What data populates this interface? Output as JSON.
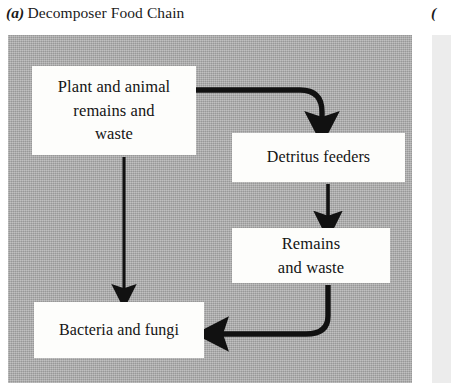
{
  "figure": {
    "panel_a": {
      "letter": "(a)",
      "title": "Decomposer Food Chain"
    },
    "panel_b": {
      "letter": "(",
      "title": ""
    },
    "colors": {
      "plate_gray": "#a9a9a9",
      "box_white": "#fdfdfb",
      "ink_black": "#141414",
      "panel_b_gray": "#ececec"
    },
    "nodes": [
      {
        "id": "plant-animal-remains-waste",
        "lines": [
          "Plant and animal",
          "remains  and",
          "waste"
        ]
      },
      {
        "id": "detritus-feeders",
        "lines": [
          "Detritus feeders"
        ]
      },
      {
        "id": "remains-and-waste",
        "lines": [
          "Remains",
          "and waste"
        ]
      },
      {
        "id": "bacteria-and-fungi",
        "lines": [
          "Bacteria and fungi"
        ]
      }
    ],
    "arrows": [
      {
        "id": "arrow-source-to-detritus",
        "from": "plant-animal-remains-waste",
        "to": "detritus-feeders",
        "style": "curved-thick"
      },
      {
        "id": "arrow-source-to-bacteria",
        "from": "plant-animal-remains-waste",
        "to": "bacteria-and-fungi",
        "style": "straight-vertical"
      },
      {
        "id": "arrow-detritus-to-remains",
        "from": "detritus-feeders",
        "to": "remains-and-waste",
        "style": "straight-vertical-short"
      },
      {
        "id": "arrow-remains-to-bacteria",
        "from": "remains-and-waste",
        "to": "bacteria-and-fungi",
        "style": "curved-thick"
      }
    ]
  }
}
